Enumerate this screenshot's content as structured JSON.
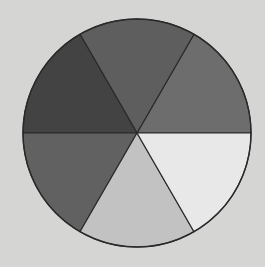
{
  "figure": {
    "type": "segmented-circle",
    "segment_count": 6,
    "center": [
      137,
      133
    ],
    "radius": 114,
    "background": "#d5d5d3",
    "outline_color": "#2a2a2a",
    "segments": [
      {
        "name": "right-upper",
        "start_deg": 0,
        "end_deg": 60,
        "color": "#6d6d6d"
      },
      {
        "name": "top",
        "start_deg": 60,
        "end_deg": 120,
        "color": "#5e5e5e"
      },
      {
        "name": "left-upper",
        "start_deg": 120,
        "end_deg": 180,
        "color": "#434343"
      },
      {
        "name": "left-lower",
        "start_deg": 180,
        "end_deg": 240,
        "color": "#616161"
      },
      {
        "name": "bottom",
        "start_deg": 240,
        "end_deg": 300,
        "color": "#c2c2c2"
      },
      {
        "name": "right-lower",
        "start_deg": 300,
        "end_deg": 360,
        "color": "#e8e8e8"
      }
    ]
  }
}
